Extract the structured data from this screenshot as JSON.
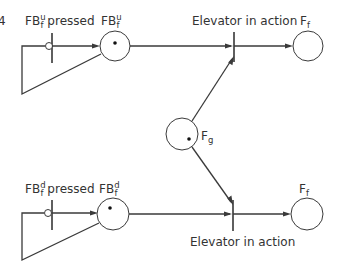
{
  "figure": {
    "fig_number_fragment": "4",
    "colors": {
      "stroke": "#3a3a3a",
      "text": "#333333",
      "token": "#111111",
      "background": "#ffffff"
    }
  },
  "places": [
    {
      "id": "FBu",
      "base": "FB",
      "sub": "f",
      "sup": "u",
      "cx": 115,
      "cy": 46,
      "r": 15,
      "token": [
        115,
        43
      ],
      "label_x": 101,
      "label_y": 25
    },
    {
      "id": "Ff_top",
      "base": "F",
      "sub": "f",
      "sup": "",
      "cx": 308,
      "cy": 46,
      "r": 15,
      "token": null,
      "label_x": 300,
      "label_y": 25
    },
    {
      "id": "Fg",
      "base": "F",
      "sub": "g",
      "sup": "",
      "cx": 182,
      "cy": 134,
      "r": 16,
      "token": [
        189,
        139
      ],
      "label_x": 201,
      "label_y": 140
    },
    {
      "id": "FBd",
      "base": "FB",
      "sub": "f",
      "sup": "d",
      "cx": 113,
      "cy": 214,
      "r": 16,
      "token": [
        110,
        208
      ],
      "label_x": 99,
      "label_y": 193
    },
    {
      "id": "Ff_bottom",
      "base": "F",
      "sub": "f",
      "sup": "",
      "cx": 307,
      "cy": 214,
      "r": 16,
      "token": null,
      "label_x": 299,
      "label_y": 193
    }
  ],
  "transitions": [
    {
      "id": "FBu_pressed",
      "label_base": "FB",
      "label_sub": "f",
      "label_sup": "u",
      "label_rest": " pressed",
      "x": 52,
      "y1": 33,
      "y2": 63,
      "label_x": 25,
      "label_y": 25,
      "inhibitor": [
        49,
        46
      ]
    },
    {
      "id": "elevator_top",
      "label": "Elevator in action",
      "x": 234,
      "y1": 32,
      "y2": 62,
      "label_x": 192,
      "label_y": 25
    },
    {
      "id": "FBd_pressed",
      "label_base": "FB",
      "label_sub": "f",
      "label_sup": "d",
      "label_rest": " pressed",
      "x": 52,
      "y1": 200,
      "y2": 230,
      "label_x": 25,
      "label_y": 193,
      "inhibitor": [
        48,
        213
      ]
    },
    {
      "id": "elevator_bottom",
      "label": "Elevator in action",
      "x": 233,
      "y1": 200,
      "y2": 231,
      "label_x": 190,
      "label_y": 246
    }
  ],
  "labels": {
    "fbu_pressed": {
      "base": "FB",
      "sup": "u",
      "sub": "f",
      "rest": " pressed"
    },
    "fbu": {
      "base": "FB",
      "sup": "u",
      "sub": "f"
    },
    "elevator_top": "Elevator in action",
    "ff_top": {
      "base": "F",
      "sub": "f"
    },
    "fg": {
      "base": "F",
      "sub": "g"
    },
    "fbd_pressed": {
      "base": "FB",
      "sup": "d",
      "sub": "f",
      "rest": " pressed"
    },
    "fbd": {
      "base": "FB",
      "sup": "d",
      "sub": "f"
    },
    "elevator_bottom": "Elevator in action",
    "ff_bottom": {
      "base": "F",
      "sub": "f"
    }
  }
}
